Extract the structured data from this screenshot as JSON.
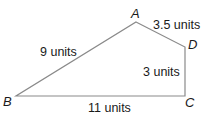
{
  "figure": {
    "type": "quadrilateral",
    "colors": {
      "edge": "#8a8a8a",
      "text": "#1a1a1a",
      "background": "#ffffff"
    },
    "vertices": {
      "A": {
        "label": "A",
        "x": 136,
        "y": 22
      },
      "B": {
        "label": "B",
        "x": 16,
        "y": 96
      },
      "C": {
        "label": "C",
        "x": 185,
        "y": 96
      },
      "D": {
        "label": "D",
        "x": 185,
        "y": 47
      }
    },
    "sides": {
      "AB": {
        "label": "9 units"
      },
      "AD": {
        "label": "3.5 units"
      },
      "DC": {
        "label": "3 units"
      },
      "BC": {
        "label": "11 units"
      }
    }
  }
}
